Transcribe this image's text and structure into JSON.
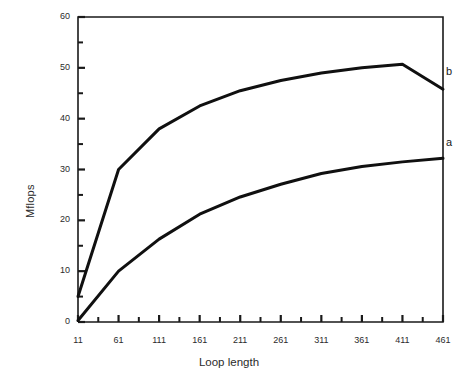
{
  "chart_data": {
    "type": "line",
    "title": "",
    "xlabel": "Loop length",
    "ylabel": "Mflops",
    "xlim": [
      11,
      461
    ],
    "ylim": [
      0,
      60
    ],
    "xticks": [
      11,
      61,
      111,
      161,
      211,
      261,
      311,
      361,
      411,
      461
    ],
    "xtick_labels": [
      "11",
      "61",
      "111",
      "161",
      "211",
      "261",
      "311",
      "361",
      "411",
      "461"
    ],
    "x_minor_tick_step": 25,
    "yticks": [
      0,
      10,
      20,
      30,
      40,
      50,
      60
    ],
    "ytick_labels": [
      "0",
      "10",
      "20",
      "30",
      "40",
      "50",
      "60"
    ],
    "y_minor_tick_step": 5,
    "grid": false,
    "legend_position": "inline-right-end",
    "frame": "box",
    "line_color": "#101010",
    "line_width": 3,
    "series": [
      {
        "name": "b",
        "label": "b",
        "x": [
          11,
          61,
          111,
          161,
          211,
          261,
          311,
          361,
          411,
          461
        ],
        "values": [
          5,
          30,
          38,
          42.5,
          45.5,
          47.5,
          49,
          50,
          50.7,
          45.8
        ]
      },
      {
        "name": "a",
        "label": "a",
        "x": [
          11,
          61,
          111,
          161,
          211,
          261,
          311,
          361,
          411,
          461
        ],
        "values": [
          0.3,
          10,
          16.3,
          21.2,
          24.6,
          27.1,
          29.2,
          30.6,
          31.5,
          32.2
        ]
      }
    ]
  }
}
